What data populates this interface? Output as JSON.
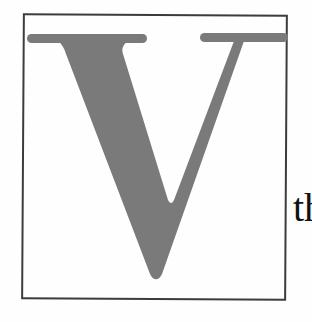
{
  "document": {
    "drop_cap": {
      "letter": "V",
      "letter_color": "#7a7a7a",
      "frame_color": "#3c3c3c"
    },
    "body_text": {
      "visible_fragment": "th",
      "color": "#111111"
    }
  }
}
